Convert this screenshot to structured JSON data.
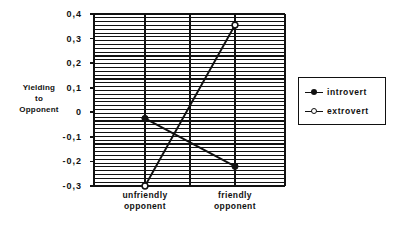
{
  "chart_data": {
    "type": "line",
    "title": "",
    "subtitle": "",
    "xlabel": "",
    "ylabel": "Yielding to Opponent",
    "ylabel_lines": [
      "Yielding",
      "to",
      "Opponent"
    ],
    "categories": [
      "unfriendly opponent",
      "friendly opponent"
    ],
    "category_lines": [
      [
        "unfriendly",
        "opponent"
      ],
      [
        "friendly",
        "opponent"
      ]
    ],
    "series": [
      {
        "name": "introvert",
        "marker": "filled-circle",
        "values": [
          -0.025,
          -0.22
        ]
      },
      {
        "name": "extrovert",
        "marker": "open-circle",
        "values": [
          -0.3,
          0.355
        ]
      }
    ],
    "ylim": [
      -0.3,
      0.4
    ],
    "yticks": [
      0.4,
      0.3,
      0.2,
      0.1,
      0,
      -0.1,
      -0.2,
      -0.3
    ],
    "ytick_labels": [
      "0,4",
      "0,3",
      "0,2",
      "0,1",
      "0",
      "-0,1",
      "-0,2",
      "-0,3"
    ],
    "grid": {
      "horizontal": true,
      "horizontal_count": 45,
      "vertical": true,
      "vertical_count": 3
    },
    "legend": {
      "position": "right",
      "entries": [
        {
          "label": "introvert",
          "marker": "filled-circle"
        },
        {
          "label": "extrovert",
          "marker": "open-circle"
        }
      ]
    },
    "colors": {
      "line": "#111111",
      "grid": "#111111",
      "axis": "#111111",
      "background": "#ffffff",
      "marker_fill_introvert": "#111111",
      "marker_fill_extrovert": "#ffffff"
    }
  }
}
